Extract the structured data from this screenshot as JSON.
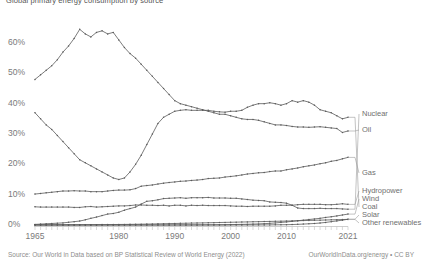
{
  "chart": {
    "title": "Global primary energy consumption by source",
    "source_left": "Source: Our World in Data based on BP Statistical Review of World Energy (2022)",
    "source_right": "OurWorldInData.org/energy • CC BY"
  },
  "axes": {
    "y_ticks": [
      "0%",
      "10%",
      "20%",
      "30%",
      "40%",
      "50%",
      "60%"
    ],
    "x_ticks": [
      "1965",
      "1980",
      "1990",
      "2000",
      "2010",
      "2021"
    ]
  },
  "legend": {
    "items": [
      {
        "label": "Nuclear"
      },
      {
        "label": "Oil"
      },
      {
        "label": "Gas"
      },
      {
        "label": "Hydropower"
      },
      {
        "label": "Wind"
      },
      {
        "label": "Coal"
      },
      {
        "label": "Solar"
      },
      {
        "label": "Other renewables"
      }
    ]
  },
  "chart_data": {
    "type": "line",
    "title": "Global primary energy consumption by source",
    "xlabel": "",
    "ylabel": "Share of primary energy",
    "xlim": [
      1965,
      2021
    ],
    "ylim": [
      0,
      68
    ],
    "grid": false,
    "legend_position": "right",
    "x": [
      1965,
      1966,
      1967,
      1968,
      1969,
      1970,
      1971,
      1972,
      1973,
      1974,
      1975,
      1976,
      1977,
      1978,
      1979,
      1980,
      1981,
      1982,
      1983,
      1984,
      1985,
      1986,
      1987,
      1988,
      1989,
      1990,
      1991,
      1992,
      1993,
      1994,
      1995,
      1996,
      1997,
      1998,
      1999,
      2000,
      2001,
      2002,
      2003,
      2004,
      2005,
      2006,
      2007,
      2008,
      2009,
      2010,
      2011,
      2012,
      2013,
      2014,
      2015,
      2016,
      2017,
      2018,
      2019,
      2020,
      2021
    ],
    "series": [
      {
        "name": "Oil",
        "values": [
          48.0,
          49.5,
          51.0,
          52.5,
          54.5,
          57.0,
          59.0,
          61.5,
          64.5,
          63.0,
          62.0,
          63.5,
          64.0,
          63.0,
          63.5,
          61.0,
          58.5,
          56.5,
          55.0,
          53.0,
          51.0,
          49.0,
          47.0,
          45.0,
          43.0,
          41.0,
          40.0,
          39.5,
          39.0,
          38.5,
          38.0,
          37.5,
          37.0,
          36.5,
          36.5,
          36.0,
          35.5,
          35.0,
          34.8,
          34.8,
          34.5,
          34.0,
          33.5,
          33.0,
          33.0,
          32.8,
          32.5,
          32.3,
          32.3,
          32.2,
          32.3,
          32.4,
          32.2,
          32.0,
          31.8,
          30.5,
          31.0
        ]
      },
      {
        "name": "Coal",
        "values": [
          37.0,
          35.0,
          33.0,
          31.5,
          29.5,
          27.5,
          25.5,
          23.5,
          21.5,
          20.5,
          19.5,
          18.5,
          17.5,
          16.5,
          15.5,
          15.0,
          15.5,
          17.5,
          20.0,
          23.0,
          26.5,
          30.0,
          33.5,
          35.5,
          36.5,
          37.5,
          37.8,
          38.0,
          37.8,
          37.8,
          37.8,
          37.8,
          37.5,
          37.3,
          37.2,
          37.5,
          37.5,
          37.8,
          38.8,
          39.5,
          40.0,
          40.0,
          40.3,
          40.0,
          39.5,
          40.0,
          41.0,
          40.5,
          41.0,
          40.5,
          39.5,
          38.0,
          37.5,
          37.0,
          36.0,
          35.0,
          35.5
        ]
      },
      {
        "name": "Gas",
        "values": [
          10.2,
          10.4,
          10.6,
          10.8,
          11.0,
          11.2,
          11.2,
          11.3,
          11.2,
          11.2,
          11.0,
          11.0,
          11.0,
          11.2,
          11.4,
          11.5,
          11.5,
          11.6,
          12.0,
          12.8,
          13.0,
          13.2,
          13.5,
          13.8,
          14.0,
          14.2,
          14.4,
          14.5,
          14.7,
          14.8,
          15.0,
          15.3,
          15.4,
          15.5,
          15.8,
          16.0,
          16.2,
          16.5,
          16.8,
          17.0,
          17.2,
          17.3,
          17.6,
          17.8,
          17.8,
          18.2,
          18.5,
          18.8,
          19.2,
          19.5,
          19.8,
          20.2,
          20.5,
          21.0,
          21.3,
          21.8,
          22.3
        ]
      },
      {
        "name": "Nuclear",
        "values": [
          0.2,
          0.3,
          0.4,
          0.5,
          0.6,
          0.7,
          0.9,
          1.1,
          1.3,
          1.7,
          2.2,
          2.6,
          3.1,
          3.6,
          3.8,
          4.2,
          4.9,
          5.4,
          5.9,
          6.9,
          7.8,
          8.0,
          8.3,
          8.7,
          8.8,
          8.9,
          9.0,
          8.8,
          9.0,
          9.0,
          9.0,
          9.1,
          8.9,
          8.9,
          8.9,
          8.8,
          8.8,
          8.6,
          8.4,
          8.2,
          8.1,
          8.0,
          7.6,
          7.5,
          7.4,
          7.2,
          6.5,
          5.6,
          5.4,
          5.4,
          5.4,
          5.5,
          5.4,
          5.4,
          5.4,
          5.3,
          5.2
        ]
      },
      {
        "name": "Hydropower",
        "values": [
          6.0,
          5.9,
          5.9,
          5.9,
          5.9,
          5.9,
          5.9,
          5.8,
          5.8,
          6.0,
          6.1,
          5.9,
          6.0,
          6.1,
          6.2,
          6.3,
          6.3,
          6.4,
          6.6,
          6.6,
          6.5,
          6.5,
          6.4,
          6.5,
          6.3,
          6.5,
          6.5,
          6.3,
          6.5,
          6.4,
          6.5,
          6.4,
          6.4,
          6.4,
          6.4,
          6.3,
          6.2,
          6.2,
          6.1,
          6.2,
          6.2,
          6.2,
          6.2,
          6.3,
          6.5,
          6.5,
          6.5,
          6.7,
          6.8,
          6.8,
          6.8,
          6.8,
          6.7,
          6.7,
          6.8,
          7.0,
          6.8
        ]
      },
      {
        "name": "Wind",
        "values": [
          0.0,
          0.0,
          0.0,
          0.0,
          0.0,
          0.0,
          0.0,
          0.0,
          0.0,
          0.0,
          0.0,
          0.0,
          0.0,
          0.0,
          0.0,
          0.0,
          0.0,
          0.0,
          0.0,
          0.0,
          0.0,
          0.0,
          0.0,
          0.0,
          0.0,
          0.02,
          0.02,
          0.03,
          0.03,
          0.04,
          0.05,
          0.06,
          0.07,
          0.09,
          0.11,
          0.14,
          0.17,
          0.2,
          0.24,
          0.3,
          0.36,
          0.44,
          0.55,
          0.68,
          0.85,
          1.0,
          1.2,
          1.4,
          1.6,
          1.8,
          2.0,
          2.2,
          2.5,
          2.7,
          3.0,
          3.3,
          3.6
        ]
      },
      {
        "name": "Solar",
        "values": [
          0.0,
          0.0,
          0.0,
          0.0,
          0.0,
          0.0,
          0.0,
          0.0,
          0.0,
          0.0,
          0.0,
          0.0,
          0.0,
          0.0,
          0.0,
          0.0,
          0.0,
          0.0,
          0.0,
          0.0,
          0.0,
          0.0,
          0.0,
          0.0,
          0.0,
          0.0,
          0.0,
          0.0,
          0.0,
          0.0,
          0.0,
          0.0,
          0.0,
          0.0,
          0.0,
          0.0,
          0.01,
          0.01,
          0.01,
          0.02,
          0.02,
          0.03,
          0.04,
          0.06,
          0.08,
          0.1,
          0.15,
          0.22,
          0.3,
          0.4,
          0.5,
          0.65,
          0.85,
          1.1,
          1.35,
          1.6,
          1.9
        ]
      },
      {
        "name": "Other renewables",
        "values": [
          0.05,
          0.05,
          0.06,
          0.06,
          0.07,
          0.07,
          0.08,
          0.08,
          0.09,
          0.1,
          0.11,
          0.12,
          0.13,
          0.14,
          0.15,
          0.17,
          0.19,
          0.21,
          0.24,
          0.27,
          0.3,
          0.34,
          0.38,
          0.42,
          0.46,
          0.5,
          0.54,
          0.58,
          0.62,
          0.66,
          0.7,
          0.74,
          0.78,
          0.82,
          0.86,
          0.9,
          0.94,
          0.98,
          1.02,
          1.06,
          1.1,
          1.14,
          1.18,
          1.22,
          1.26,
          1.3,
          1.35,
          1.4,
          1.45,
          1.5,
          1.55,
          1.6,
          1.65,
          1.7,
          1.75,
          1.8,
          1.85
        ]
      }
    ]
  }
}
